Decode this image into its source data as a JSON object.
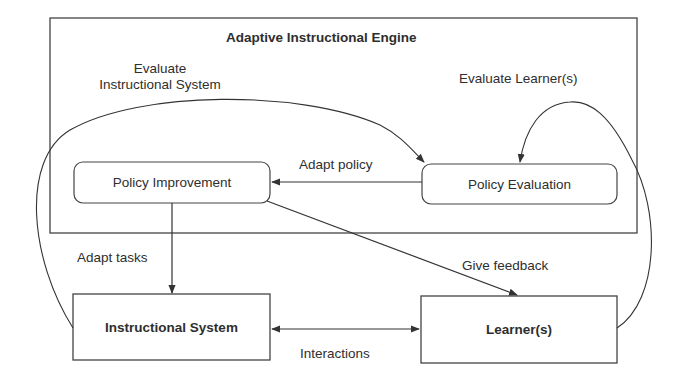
{
  "diagram": {
    "title": "Adaptive Instructional Engine",
    "nodes": {
      "policy_improvement": "Policy Improvement",
      "policy_evaluation": "Policy Evaluation",
      "instructional_system": "Instructional System",
      "learners": "Learner(s)"
    },
    "edges": {
      "evaluate_instructional_system_line1": "Evaluate",
      "evaluate_instructional_system_line2": "Instructional System",
      "evaluate_learners": "Evaluate Learner(s)",
      "adapt_policy": "Adapt policy",
      "adapt_tasks": "Adapt tasks",
      "give_feedback": "Give feedback",
      "interactions": "Interactions"
    },
    "colors": {
      "stroke": "#3a3a3a",
      "text": "#2e2e2e",
      "background": "#ffffff"
    }
  }
}
